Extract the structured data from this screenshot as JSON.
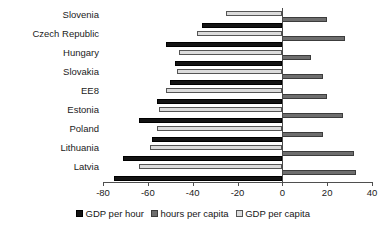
{
  "chart_data": {
    "type": "bar",
    "orientation": "horizontal",
    "title": "",
    "subtitle": "",
    "xlabel": "",
    "ylabel": "",
    "xlim": [
      -80,
      40
    ],
    "xticks": [
      -80,
      -60,
      -40,
      -20,
      0,
      20,
      40
    ],
    "xtick_labels": [
      "-80",
      "-60",
      "-40",
      "-20",
      "0",
      "20",
      "40"
    ],
    "grid": false,
    "legend_position": "bottom",
    "categories": [
      "Slovenia",
      "Czech Republic",
      "Hungary",
      "Slovakia",
      "EE8",
      "Estonia",
      "Poland",
      "Lithuania",
      "Latvia"
    ],
    "series": [
      {
        "name": "GDP per hour",
        "color": "#131313",
        "values": [
          -36,
          -52,
          -48,
          -50,
          -56,
          -64,
          -58,
          -71,
          -75
        ]
      },
      {
        "name": "hours per capita",
        "color": "#6e6e6e",
        "values": [
          20,
          28,
          13,
          18,
          20,
          27,
          18,
          32,
          33
        ]
      },
      {
        "name": "GDP per capita",
        "color": "#dcdcdc",
        "values": [
          -25,
          -38,
          -46,
          -47,
          -52,
          -55,
          -56,
          -59,
          -64
        ]
      }
    ]
  },
  "legend": {
    "entries": [
      {
        "label": "GDP per hour",
        "key": "s-gdp-per-hour"
      },
      {
        "label": "hours per capita",
        "key": "s-hours-per-capita"
      },
      {
        "label": "GDP per capita",
        "key": "s-gdp-per-capita"
      }
    ]
  },
  "axis": {
    "zero_label": "0"
  }
}
